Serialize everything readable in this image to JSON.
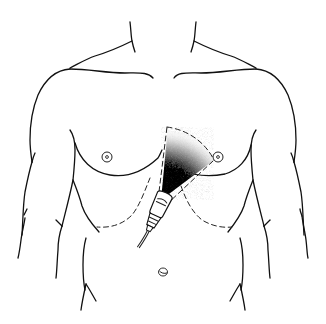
{
  "figure": {
    "title": "Transthoracic ultrasound probe placement on male torso",
    "elements": [
      "neck",
      "clavicles",
      "shoulders",
      "arms",
      "pectoral-lines",
      "nipples",
      "ultrasound-probe",
      "ultrasound-beam-sector",
      "costal-margin-dashed",
      "abdominal-lines",
      "navel"
    ],
    "colors": {
      "background": "#ffffff",
      "line": "#111111",
      "beam_dark": "#000000",
      "beam_light": "#ffffff"
    }
  }
}
